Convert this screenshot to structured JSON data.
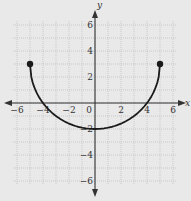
{
  "chart_data": {
    "type": "line",
    "title": "",
    "xlabel": "x",
    "ylabel": "y",
    "xlim": [
      -6,
      6
    ],
    "ylim": [
      -6,
      6
    ],
    "grid": true,
    "x_ticks": [
      -6,
      -4,
      -2,
      0,
      2,
      4,
      6
    ],
    "y_ticks": [
      6,
      4,
      2,
      -2,
      -4,
      -6
    ],
    "x_tick_labels": [
      "−6",
      "−4",
      "−2",
      "0",
      "2",
      "4",
      "6"
    ],
    "y_tick_labels": [
      "6",
      "4",
      "2",
      "−2",
      "−4",
      "−6"
    ],
    "series": [
      {
        "name": "curve",
        "description": "Lower half of circle centered (0,3) radius 5",
        "x": [
          -5,
          -4,
          -3,
          0,
          3,
          4,
          5
        ],
        "y": [
          3,
          0,
          -1,
          -2,
          -1,
          0,
          3
        ],
        "endpoints": [
          {
            "x": -5,
            "y": 3,
            "closed": true
          },
          {
            "x": 5,
            "y": 3,
            "closed": true
          }
        ]
      }
    ]
  },
  "colors": {
    "background": "#e9e9e9",
    "grid": "#bdbdbd",
    "axis": "#333333",
    "curve": "#1a1a1a"
  }
}
